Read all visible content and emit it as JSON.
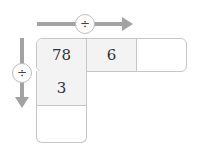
{
  "operations": {
    "horizontal": {
      "symbol": "÷",
      "direction": "right"
    },
    "vertical": {
      "symbol": "÷",
      "direction": "down"
    }
  },
  "grid": {
    "row": [
      "78",
      "6",
      ""
    ],
    "column": [
      "3",
      ""
    ]
  },
  "colors": {
    "arrow": "#a3a3a3",
    "border": "#c6c6c6",
    "filled_cell": "#f3f3f3"
  }
}
